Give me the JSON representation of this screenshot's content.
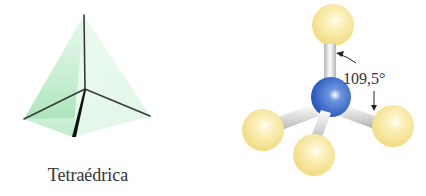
{
  "figure": {
    "left": {
      "shape_name": "Tetraédrica",
      "icon": "tetrahedron-icon",
      "face_color": "#9be3b0",
      "edge_color": "#333333"
    },
    "right": {
      "icon": "ball-and-stick-molecule-icon",
      "bond_angle_label": "109,5°",
      "central_atom_color": "#2f63c8",
      "outer_atom_color": "#f5e08a",
      "bond_color": "#d9d9d9"
    }
  }
}
